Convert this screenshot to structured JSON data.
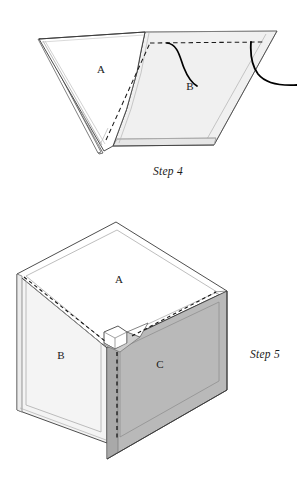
{
  "document": {
    "type": "craft-instruction-illustration",
    "background_color": "#ffffff",
    "line_color": "#2b2b2b",
    "width": 297,
    "height": 486
  },
  "figures": [
    {
      "id": "step-4",
      "caption": "Step 4",
      "caption_position": {
        "x": 168,
        "y": 172
      },
      "description": "Flat fabric piece A folded to a V point on the left with stacked layers, joined to flat panel B on the right; a dashed stitching line runs along the seam and a curved thread with needle passes over panel B.",
      "labels": [
        {
          "text": "A",
          "x": 101,
          "y": 70
        },
        {
          "text": "B",
          "x": 190,
          "y": 87
        }
      ],
      "colors": {
        "panel_a_fill": "#ffffff",
        "panel_b_fill": "#f0f0f0",
        "panel_b_edge_fill": "#e4e4e4",
        "stroke": "#2b2b2b",
        "light_stroke": "#9a9a9a",
        "thread": "#000000"
      },
      "elements": [
        "panel-a-triangle",
        "panel-a-under-layer",
        "panel-b-quad",
        "panel-b-hem-band",
        "dashed-stitch-line",
        "thread-curve"
      ]
    },
    {
      "id": "step-5",
      "caption": "Step 5",
      "caption_position": {
        "x": 265,
        "y": 355
      },
      "description": "Assembled open-top box shown in isometric view. Top opening A, left side panel B in light gray, front-right side panel C in medium gray. Dashed stitch lines run along the inner top edge and down the front vertical corner. A small folded tab is visible at the near corner.",
      "labels": [
        {
          "text": "A",
          "x": 119,
          "y": 280
        },
        {
          "text": "B",
          "x": 61,
          "y": 356
        },
        {
          "text": "C",
          "x": 160,
          "y": 365
        }
      ],
      "colors": {
        "panel_a_fill": "#ffffff",
        "panel_b_fill": "#f4f4f4",
        "panel_c_fill": "#b9b9b9",
        "panel_c_shadow_fill": "#a8a8a8",
        "flap_fill": "#ffffff",
        "tab_fill": "#cfcfcf",
        "stroke": "#2b2b2b",
        "light_stroke": "#9a9a9a"
      },
      "elements": [
        "top-opening-a",
        "left-panel-b",
        "front-panel-c",
        "corner-tab",
        "dashed-top-stitch",
        "dashed-corner-stitch"
      ]
    }
  ]
}
